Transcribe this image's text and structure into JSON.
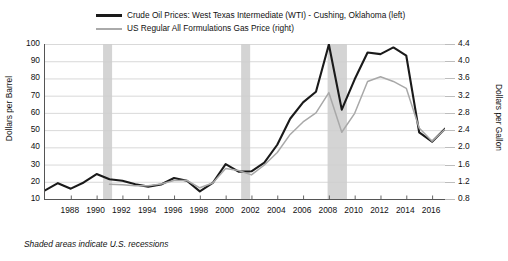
{
  "chart_data": {
    "type": "line",
    "title": "",
    "xlabel": "",
    "ylabel": "Dollars per Barrel",
    "y2label": "Dollars per Gallon",
    "xlim": [
      1986,
      2017
    ],
    "ylim": [
      10,
      100
    ],
    "y2lim": [
      0.8,
      4.4
    ],
    "grid": true,
    "legend_position": "top-center",
    "xticks": [
      1988,
      1990,
      1992,
      1994,
      1996,
      1998,
      2000,
      2002,
      2004,
      2006,
      2008,
      2010,
      2012,
      2014,
      2016
    ],
    "yticks": [
      10,
      20,
      30,
      40,
      50,
      60,
      70,
      80,
      90,
      100
    ],
    "y2ticks": [
      "0.8",
      "1.2",
      "1.6",
      "2.0",
      "2.4",
      "2.8",
      "3.2",
      "3.6",
      "4.0",
      "4.4"
    ],
    "annotations": [
      "Shaded areas indicate U.S. recessions"
    ],
    "shaded_regions": [
      {
        "label": "recession-1990-1991",
        "start": 1990.5,
        "end": 1991.2
      },
      {
        "label": "recession-2001",
        "start": 2001.2,
        "end": 2001.9
      },
      {
        "label": "recession-2008-2009",
        "start": 2007.9,
        "end": 2009.4
      }
    ],
    "series": [
      {
        "name": "Crude Oil Prices: West Texas Intermediate (WTI) - Cushing, Oklahoma (left)",
        "axis": "left",
        "color": "#1a1a1a",
        "width": 2.1,
        "x": [
          1986,
          1987,
          1988,
          1989,
          1990,
          1991,
          1992,
          1993,
          1994,
          1995,
          1996,
          1997,
          1998,
          1999,
          2000,
          2001,
          2002,
          2003,
          2004,
          2005,
          2006,
          2007,
          2008,
          2009,
          2010,
          2011,
          2012,
          2013,
          2014,
          2015,
          2016,
          2017
        ],
        "values": [
          15.0,
          19.2,
          16.0,
          19.6,
          24.5,
          21.5,
          20.6,
          18.5,
          17.2,
          18.4,
          22.2,
          20.6,
          14.4,
          19.3,
          30.3,
          25.9,
          26.1,
          31.1,
          41.5,
          56.6,
          66.1,
          72.3,
          99.7,
          61.9,
          79.5,
          95.1,
          94.1,
          98.0,
          93.2,
          48.7,
          43.3,
          50.8
        ]
      },
      {
        "name": "US Regular All Formulations Gas Price (right)",
        "axis": "right",
        "color": "#a8a8a8",
        "width": 1.5,
        "x": [
          1991,
          1992,
          1993,
          1994,
          1995,
          1996,
          1997,
          1998,
          1999,
          2000,
          2001,
          2002,
          2003,
          2004,
          2005,
          2006,
          2007,
          2008,
          2009,
          2010,
          2011,
          2012,
          2013,
          2014,
          2015,
          2016,
          2017
        ],
        "values": [
          1.14,
          1.13,
          1.11,
          1.11,
          1.15,
          1.23,
          1.23,
          1.06,
          1.17,
          1.51,
          1.46,
          1.36,
          1.59,
          1.88,
          2.3,
          2.59,
          2.8,
          3.27,
          2.35,
          2.79,
          3.53,
          3.64,
          3.53,
          3.37,
          2.45,
          2.14,
          2.42
        ]
      }
    ]
  },
  "legend": {
    "items": [
      {
        "label": "Crude Oil Prices: West Texas Intermediate (WTI) - Cushing, Oklahoma (left)",
        "icon": "line-swatch-black"
      },
      {
        "label": "US Regular All Formulations Gas Price (right)",
        "icon": "line-swatch-gray"
      }
    ]
  },
  "axes": {
    "left_title": "Dollars per Barrel",
    "right_title": "Dollars per Gallon"
  },
  "footnote": "Shaded areas indicate U.S. recessions"
}
